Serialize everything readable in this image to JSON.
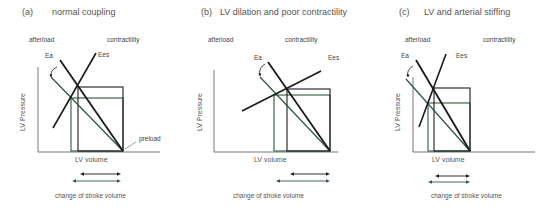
{
  "colors": {
    "black_line": "#1a1a1a",
    "green_line": "#2f5a3d",
    "axis": "#666666",
    "text": "#444444"
  },
  "panels": [
    {
      "id": "a",
      "title_letter": "(a)",
      "title_text": "normal coupling",
      "afterload_label": "afterload",
      "contractility_label": "contractility",
      "ea_label": "Ea",
      "ees_label": "Ees",
      "preload_label": "preload",
      "xlabel": "LV volume",
      "ylabel": "LV Pressure",
      "footer": "change of stroke volume",
      "geom": {
        "title_x": 22,
        "title_y": 15,
        "title_text_x": 52,
        "afterload_x": 29,
        "contractility_x": 107,
        "labels_y": 42,
        "ea_x": 45,
        "ea_y": 58,
        "ees_x": 98,
        "ees_y": 57,
        "axis_x": 38,
        "axis_top": 67,
        "axis_bottom": 152,
        "axis_right": 160,
        "ea_black": [
          60,
          60,
          123,
          151
        ],
        "ea_green": [
          51,
          77,
          123,
          151
        ],
        "ees": [
          53,
          128,
          96,
          53
        ],
        "rect_black": [
          78,
          87,
          123,
          151
        ],
        "rect_green": [
          71,
          98,
          123,
          151
        ],
        "preload_x": 139,
        "preload_y": 141,
        "preload_tick": [
          125,
          149,
          136,
          142
        ],
        "xlabel_x": 75,
        "xlabel_y": 162,
        "arrow_black": [
          80,
          121,
          174
        ],
        "arrow_green": [
          72,
          121,
          181
        ],
        "footer_x": 55,
        "footer_y": 198,
        "ylabel_x": 25,
        "ylabel_y": 112,
        "curve": [
          57,
          67,
          50,
          70,
          51,
          77
        ]
      }
    },
    {
      "id": "b",
      "title_letter": "(b)",
      "title_text": "LV dilation and poor contractility",
      "afterload_label": "afterload",
      "contractility_label": "contractility",
      "ea_label": "Ea",
      "ees_label": "Ees",
      "xlabel": "LV volume",
      "ylabel": "LV Pressure",
      "footer": "change of stroke volume",
      "geom": {
        "title_x": 201,
        "title_y": 15,
        "title_text_x": 220,
        "afterload_x": 208,
        "contractility_x": 285,
        "labels_y": 42,
        "ea_x": 254,
        "ea_y": 60,
        "ees_x": 328,
        "ees_y": 60,
        "axis_x": 214,
        "axis_top": 70,
        "axis_bottom": 152,
        "axis_right": 338,
        "ea_black": [
          268,
          62,
          330,
          151
        ],
        "ea_green": [
          260,
          77,
          330,
          151
        ],
        "ees": [
          242,
          111,
          321,
          71
        ],
        "rect_black": [
          287,
          89,
          330,
          151
        ],
        "rect_green": [
          274,
          95,
          330,
          151
        ],
        "xlabel_x": 254,
        "xlabel_y": 162,
        "arrow_black": [
          290,
          330,
          174
        ],
        "arrow_green": [
          276,
          330,
          181
        ],
        "footer_x": 233,
        "footer_y": 198,
        "ylabel_x": 202,
        "ylabel_y": 112,
        "curve": [
          265,
          64,
          258,
          68,
          260,
          76
        ]
      }
    },
    {
      "id": "c",
      "title_letter": "(c)",
      "title_text": "LV and arterial stiffing",
      "afterload_label": "afterload",
      "contractility_label": "contractility",
      "ea_label": "Ea",
      "ees_label": "Ees",
      "xlabel": "LV volume",
      "ylabel": "LV Pressure",
      "footer": "change of stroke volume",
      "geom": {
        "title_x": 399,
        "title_y": 15,
        "title_text_x": 424,
        "afterload_x": 405,
        "contractility_x": 483,
        "labels_y": 42,
        "ea_x": 401,
        "ea_y": 58,
        "ees_x": 456,
        "ees_y": 58,
        "axis_x": 413,
        "axis_top": 77,
        "axis_bottom": 152,
        "axis_right": 535,
        "ea_black": [
          416,
          60,
          470,
          151
        ],
        "ea_green": [
          406,
          79,
          470,
          151
        ],
        "ees": [
          419,
          127,
          446,
          54
        ],
        "rect_black": [
          434,
          88,
          470,
          151
        ],
        "rect_green": [
          428,
          103,
          470,
          151
        ],
        "xlabel_x": 432,
        "xlabel_y": 162,
        "arrow_black": [
          435,
          470,
          176
        ],
        "arrow_green": [
          428,
          470,
          182
        ],
        "footer_x": 431,
        "footer_y": 198,
        "ylabel_x": 400,
        "ylabel_y": 112,
        "curve": [
          413,
          66,
          406,
          70,
          408,
          77
        ]
      }
    }
  ]
}
